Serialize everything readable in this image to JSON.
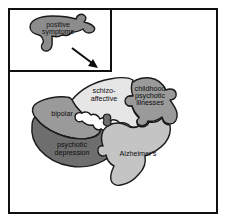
{
  "figure": {
    "background_color": "#ffffff",
    "frame_color": "#101010",
    "caption": ""
  },
  "inset": {
    "name": "positive-symptoms-inset",
    "piece": {
      "label_line1": "positive",
      "label_line2": "symptoms",
      "fill_color": "#8c8c8c",
      "stroke_color": "#1a1a1a"
    },
    "arrow": {
      "name": "arrow-down-right",
      "color": "#0d0d0d",
      "direction": "down-right"
    }
  },
  "diagram": {
    "type": "jigsaw-venn",
    "title": "",
    "pieces": [
      {
        "id": "bipolar",
        "label": "bipolar",
        "label_lines": [
          "bipolar"
        ],
        "fill_color": "#9a9a9a",
        "stroke_color": "#1a1a1a"
      },
      {
        "id": "schizo-affective",
        "label": "schizo-affective",
        "label_lines": [
          "schizo-",
          "affective"
        ],
        "fill_color": "#e6e6e6",
        "stroke_color": "#1a1a1a"
      },
      {
        "id": "childhood-psychotic-illnesses",
        "label": "childhood psychotic illnesses",
        "label_lines": [
          "childhood",
          "psychotic",
          "illnesses"
        ],
        "fill_color": "#9a9a9a",
        "stroke_color": "#1a1a1a"
      },
      {
        "id": "psychotic-depression",
        "label": "psychotic depression",
        "label_lines": [
          "psychotic",
          "depression"
        ],
        "fill_color": "#6e6e6e",
        "stroke_color": "#1a1a1a"
      },
      {
        "id": "alzheimers",
        "label": "Alzheimer's",
        "label_lines": [
          "Alzheimer's"
        ],
        "fill_color": "#c4c4c4",
        "stroke_color": "#1a1a1a"
      }
    ]
  }
}
